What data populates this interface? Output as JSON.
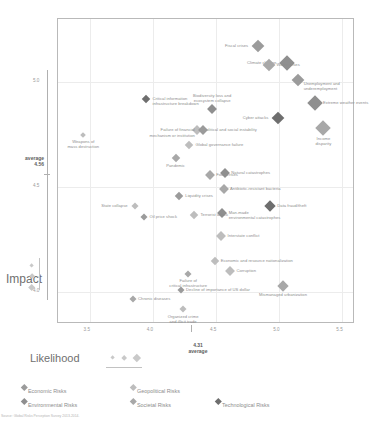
{
  "axes": {
    "x_label": "Likelihood",
    "y_label": "Impact",
    "x_ticks": [
      "3.5",
      "4.0",
      "4.5",
      "5.0",
      "5.5"
    ],
    "y_ticks": [
      "5.0",
      "4.5",
      "4.0"
    ],
    "x_average_value": "4.31",
    "x_average_caption": "average",
    "y_average_value": "4.56",
    "y_average_caption": "average",
    "xlim": [
      3.25,
      5.6
    ],
    "ylim": [
      3.85,
      5.3
    ]
  },
  "footnote": "Source: Global Risks Perception Survey 2013-2014.",
  "legend": {
    "categories": [
      {
        "label": "Economic Risks",
        "color": "#9b9b9b"
      },
      {
        "label": "Environmental Risks",
        "color": "#8f8f8f"
      },
      {
        "label": "Geopolitical Risks",
        "color": "#bdbdbd"
      },
      {
        "label": "Societal Risks",
        "color": "#a8a8a8"
      },
      {
        "label": "Technological Risks",
        "color": "#6e6e6e"
      }
    ]
  },
  "chart_data": {
    "type": "scatter",
    "title": "",
    "xlabel": "Likelihood",
    "ylabel": "Impact",
    "xlim": [
      3.25,
      5.6
    ],
    "ylim": [
      3.85,
      5.3
    ],
    "grid": true,
    "legend_position": "bottom",
    "size_encodes": "number of interconnections",
    "points": [
      {
        "label": "Fiscal crises",
        "x": 4.83,
        "y": 5.17,
        "size": 9,
        "category": "Economic Risks",
        "anchor": "left"
      },
      {
        "label": "Climate change",
        "x": 5.06,
        "y": 5.09,
        "size": 11,
        "category": "Environmental Risks",
        "anchor": "left"
      },
      {
        "label": "Water crises",
        "x": 4.92,
        "y": 5.08,
        "size": 9,
        "category": "Societal Risks",
        "anchor": "right"
      },
      {
        "label": "Unemployment and\nunderemployment",
        "x": 5.15,
        "y": 5.01,
        "size": 9,
        "category": "Economic Risks",
        "anchor": "left-below"
      },
      {
        "label": "Critical information\ninfrastructure breakdown",
        "x": 3.95,
        "y": 4.92,
        "size": 6,
        "category": "Technological Risks",
        "anchor": "right"
      },
      {
        "label": "Biodiversity loss and\necosystem collapse",
        "x": 4.47,
        "y": 4.87,
        "size": 7,
        "category": "Environmental Risks",
        "anchor": "above"
      },
      {
        "label": "Extreme weather events",
        "x": 5.28,
        "y": 4.9,
        "size": 11,
        "category": "Environmental Risks",
        "anchor": "right"
      },
      {
        "label": "Cyber attacks",
        "x": 4.99,
        "y": 4.83,
        "size": 9,
        "category": "Technological Risks",
        "anchor": "left"
      },
      {
        "label": "Income\ndisparity",
        "x": 5.35,
        "y": 4.78,
        "size": 11,
        "category": "Societal Risks",
        "anchor": "below"
      },
      {
        "label": "Political and social instability",
        "x": 4.35,
        "y": 4.77,
        "size": 7,
        "category": "Geopolitical Risks",
        "anchor": "right"
      },
      {
        "label": "Failure of financial\nmechanism or institution",
        "x": 4.4,
        "y": 4.77,
        "size": 7,
        "category": "Economic Risks",
        "anchor": "left"
      },
      {
        "label": "Weapons of\nmass destruction",
        "x": 3.45,
        "y": 4.75,
        "size": 4,
        "category": "Geopolitical Risks",
        "anchor": "below"
      },
      {
        "label": "Global governance failure",
        "x": 4.29,
        "y": 4.7,
        "size": 6,
        "category": "Geopolitical Risks",
        "anchor": "right"
      },
      {
        "label": "Pandemic",
        "x": 4.18,
        "y": 4.64,
        "size": 6,
        "category": "Societal Risks",
        "anchor": "below"
      },
      {
        "label": "Food crises",
        "x": 4.45,
        "y": 4.56,
        "size": 7,
        "category": "Societal Risks",
        "anchor": "right"
      },
      {
        "label": "Natural catastrophes",
        "x": 4.57,
        "y": 4.57,
        "size": 7,
        "category": "Environmental Risks",
        "anchor": "right"
      },
      {
        "label": "Antibiotic-resistant bacteria",
        "x": 4.56,
        "y": 4.49,
        "size": 7,
        "category": "Societal Risks",
        "anchor": "right"
      },
      {
        "label": "Liquidity crises",
        "x": 4.21,
        "y": 4.46,
        "size": 6,
        "category": "Economic Risks",
        "anchor": "right"
      },
      {
        "label": "State collapse",
        "x": 3.86,
        "y": 4.41,
        "size": 5,
        "category": "Geopolitical Risks",
        "anchor": "left"
      },
      {
        "label": "Data fraud/theft",
        "x": 4.93,
        "y": 4.41,
        "size": 8,
        "category": "Technological Risks",
        "anchor": "right"
      },
      {
        "label": "Man-made\nenvironmental catastrophes",
        "x": 4.55,
        "y": 4.38,
        "size": 7,
        "category": "Environmental Risks",
        "anchor": "right"
      },
      {
        "label": "Terrorist attack",
        "x": 4.33,
        "y": 4.37,
        "size": 6,
        "category": "Geopolitical Risks",
        "anchor": "right"
      },
      {
        "label": "Oil price shock",
        "x": 3.93,
        "y": 4.36,
        "size": 5,
        "category": "Economic Risks",
        "anchor": "right"
      },
      {
        "label": "Interstate conflict",
        "x": 4.54,
        "y": 4.27,
        "size": 7,
        "category": "Geopolitical Risks",
        "anchor": "right"
      },
      {
        "label": "Economic and resource nationalization",
        "x": 4.49,
        "y": 4.15,
        "size": 6,
        "category": "Geopolitical Risks",
        "anchor": "right"
      },
      {
        "label": "Corruption",
        "x": 4.61,
        "y": 4.1,
        "size": 7,
        "category": "Geopolitical Risks",
        "anchor": "right"
      },
      {
        "label": "Failure of\ncritical infrastructure",
        "x": 4.28,
        "y": 4.09,
        "size": 5,
        "category": "Societal Risks",
        "anchor": "below"
      },
      {
        "label": "Mismanaged urbanization",
        "x": 5.03,
        "y": 4.03,
        "size": 8,
        "category": "Societal Risks",
        "anchor": "below"
      },
      {
        "label": "Decline of importance of US dollar",
        "x": 4.22,
        "y": 4.01,
        "size": 5,
        "category": "Economic Risks",
        "anchor": "right"
      },
      {
        "label": "Chronic diseases",
        "x": 3.84,
        "y": 3.97,
        "size": 5,
        "category": "Societal Risks",
        "anchor": "right"
      },
      {
        "label": "Organized crime\nand illicit trade",
        "x": 4.24,
        "y": 3.92,
        "size": 5,
        "category": "Geopolitical Risks",
        "anchor": "below"
      }
    ]
  }
}
